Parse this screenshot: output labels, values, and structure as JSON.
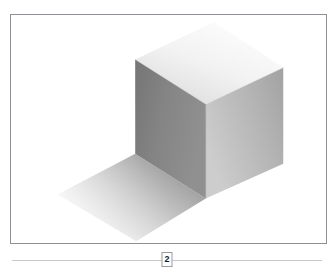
{
  "page": {
    "background_color": "#ffffff",
    "width": 334,
    "height": 274
  },
  "figure": {
    "frame": {
      "border_color": "#8d9094",
      "background_color": "#ffffff",
      "x": 10,
      "y": 14,
      "width": 317,
      "height": 230
    },
    "caption": "",
    "illustration": {
      "type": "isometric-cube-render",
      "faces": [
        {
          "name": "top-face",
          "points": "136,60 215,22 285,68 207,105",
          "gradient": {
            "from": "#fbfbfb",
            "to": "#d8d8d8",
            "angle": "135deg"
          }
        },
        {
          "name": "left-face",
          "points": "136,60 207,105 207,200 136,155",
          "gradient": {
            "from": "#7b7b7b",
            "to": "#8f8f8f",
            "angle": "90deg"
          }
        },
        {
          "name": "right-face",
          "points": "207,105 285,68 285,165 207,200",
          "gradient": {
            "from": "#c6c6c6",
            "to": "#a9a9a9",
            "angle": "90deg"
          }
        }
      ],
      "shadow": {
        "name": "cast-shadow",
        "points": "136,155 207,200 137,243 58,196",
        "gradient": {
          "from": "#9a9a9a",
          "to": "#f4f4f4"
        }
      }
    }
  },
  "footer": {
    "rule_color": "#c9c9c9",
    "page_number": "2",
    "page_number_border_color": "#9a9a9a"
  }
}
